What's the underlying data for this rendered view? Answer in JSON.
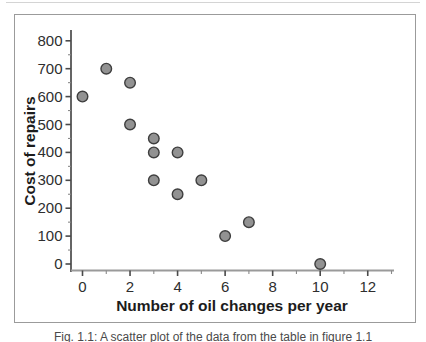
{
  "figure": {
    "caption": "Fig. 1.1: A scatter plot of the data from the table in figure 1.1"
  },
  "chart_data": {
    "type": "scatter",
    "title": "",
    "xlabel": "Number of oil changes per year",
    "ylabel": "Cost of repairs",
    "points": [
      {
        "x": 0,
        "y": 600
      },
      {
        "x": 1,
        "y": 700
      },
      {
        "x": 2,
        "y": 650
      },
      {
        "x": 2,
        "y": 500
      },
      {
        "x": 3,
        "y": 450
      },
      {
        "x": 3,
        "y": 400
      },
      {
        "x": 3,
        "y": 300
      },
      {
        "x": 4,
        "y": 400
      },
      {
        "x": 4,
        "y": 250
      },
      {
        "x": 5,
        "y": 300
      },
      {
        "x": 6,
        "y": 100
      },
      {
        "x": 7,
        "y": 150
      },
      {
        "x": 10,
        "y": 0
      }
    ],
    "xlim": [
      0,
      13
    ],
    "ylim": [
      0,
      840
    ],
    "x_major_ticks": [
      0,
      2,
      4,
      6,
      8,
      10,
      12
    ],
    "x_minor_ticks": [
      1,
      3,
      5,
      7,
      9,
      11,
      13
    ],
    "y_major_ticks": [
      0,
      100,
      200,
      300,
      400,
      500,
      600,
      700,
      800
    ],
    "y_minor_ticks": [
      50,
      150,
      250,
      350,
      450,
      550,
      650,
      750
    ],
    "x_tick_labels": [
      "0",
      "2",
      "4",
      "6",
      "8",
      "10",
      "12"
    ],
    "y_tick_labels": [
      "0",
      "100",
      "200",
      "300",
      "400",
      "500",
      "600",
      "700",
      "800"
    ],
    "grid": false,
    "legend": null,
    "marker": {
      "fill": "#929292",
      "stroke": "#3e3e3e",
      "radius": 5.3
    }
  },
  "colors": {
    "frame_border": "#9b9b9b",
    "y_axis": "#4a4a4a",
    "x_axis": "#9a9a9a",
    "major_tick": "#4a4a4a",
    "minor_tick": "#8a8a8a",
    "tick_label": "#2e2e2e",
    "axis_title": "#1c1c1c",
    "caption_text": "#4a4a4a",
    "top_divider": "#d4d4d4"
  }
}
